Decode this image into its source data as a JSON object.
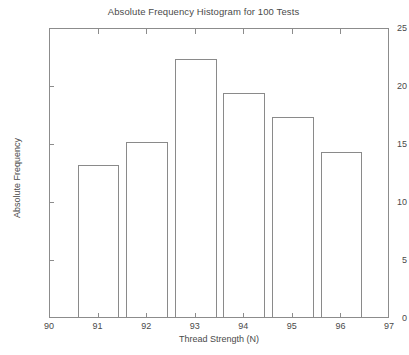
{
  "chart_data": {
    "type": "bar",
    "title": "Absolute Frequency Histogram for 100 Tests",
    "xlabel": "Thread Strength (N)",
    "ylabel": "Absolute Frequency",
    "categories": [
      "91",
      "92",
      "93",
      "94",
      "95",
      "96"
    ],
    "values": [
      13.1,
      15.1,
      22.2,
      19.3,
      17.2,
      14.2
    ],
    "xlim": [
      90,
      97
    ],
    "ylim": [
      0,
      25
    ],
    "x_ticks": [
      "90",
      "91",
      "92",
      "93",
      "94",
      "95",
      "96",
      "97"
    ],
    "x_tick_values": [
      90,
      91,
      92,
      93,
      94,
      95,
      96,
      97
    ],
    "y_ticks": [
      "0",
      "5",
      "10",
      "15",
      "20",
      "25"
    ],
    "y_tick_values": [
      0,
      5,
      10,
      15,
      20,
      25
    ],
    "grid": false,
    "legend": null,
    "bar_fill_color": "#ffffff",
    "bar_edge_color": "#8a8a8a",
    "axis_color": "#8c8c8c",
    "background_color": "#ffffff",
    "bar_width_units": 0.86
  }
}
